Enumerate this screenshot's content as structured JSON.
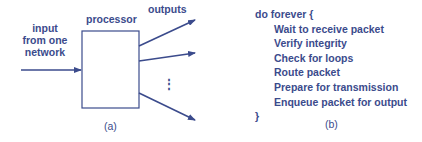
{
  "panel_a": {
    "input_label": [
      "input",
      "from one",
      "network"
    ],
    "processor_label": "processor",
    "outputs_label": "outputs",
    "ellipsis": "⋮",
    "caption": "(a)"
  },
  "panel_b": {
    "open_line": "do forever  {",
    "steps": [
      "Wait to receive packet",
      "Verify integrity",
      "Check for loops",
      "Route packet",
      "Prepare for transmission",
      "Enqueue packet for output"
    ],
    "close_line": "}",
    "caption": "(b)"
  },
  "colors": {
    "ink": "#3b4b8c"
  }
}
